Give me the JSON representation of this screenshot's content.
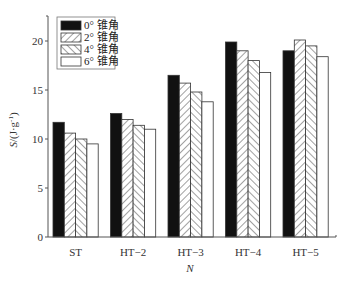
{
  "chart_data": {
    "type": "bar",
    "title": "",
    "xlabel": "N",
    "ylabel": "S/(J·g⁻¹)",
    "ylim": [
      0,
      22.3
    ],
    "yticks": [
      0,
      5,
      10,
      15,
      20
    ],
    "grid": false,
    "legend_position": "upper-left",
    "categories": [
      "ST",
      "HT-2",
      "HT-3",
      "HT-4",
      "HT-5"
    ],
    "series": [
      {
        "name": "0° 锥角",
        "pattern": "solid-black",
        "values": [
          11.7,
          12.6,
          16.5,
          19.9,
          19.0
        ]
      },
      {
        "name": "2° 锥角",
        "pattern": "diagonal-hatch-right",
        "values": [
          10.6,
          12.0,
          15.7,
          19.0,
          20.1
        ]
      },
      {
        "name": "4° 锥角",
        "pattern": "diagonal-hatch-left",
        "values": [
          10.0,
          11.4,
          14.8,
          18.0,
          19.5
        ]
      },
      {
        "name": "6° 锥角",
        "pattern": "white",
        "values": [
          9.5,
          11.0,
          13.8,
          16.8,
          18.4
        ]
      }
    ]
  },
  "axes": {
    "x_label": "N",
    "y_label_main": "S",
    "y_label_unit": "/(J·g",
    "y_label_exp": "-1",
    "y_label_close": ")"
  },
  "legend": {
    "items": [
      {
        "label": "0° 锥角"
      },
      {
        "label": "2° 锥角"
      },
      {
        "label": "4° 锥角"
      },
      {
        "label": "6° 锥角"
      }
    ]
  },
  "colors": {
    "axis": "#555555",
    "bar_stroke": "#333333",
    "solid": "#111111",
    "hatch": "#444444",
    "background": "#ffffff"
  }
}
